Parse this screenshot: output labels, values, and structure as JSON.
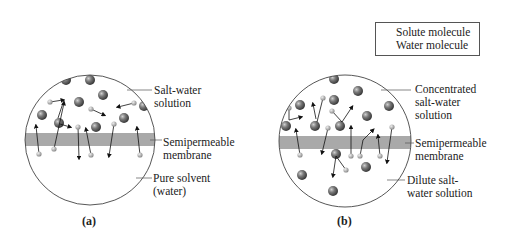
{
  "legend": {
    "solute_label": "Solute molecule",
    "water_label": "Water molecule"
  },
  "panel_a": {
    "caption": "(a)",
    "top_label_1": "Salt-water",
    "top_label_2": "solution",
    "membrane_label_1": "Semipermeable",
    "membrane_label_2": "membrane",
    "bottom_label_1": "Pure solvent",
    "bottom_label_2": "(water)"
  },
  "panel_b": {
    "caption": "(b)",
    "top_label_1": "Concentrated",
    "top_label_2": "salt-water",
    "top_label_3": "solution",
    "membrane_label_1": "Semipermeable",
    "membrane_label_2": "membrane",
    "bottom_label_1": "Dilute salt-",
    "bottom_label_2": "water solution"
  },
  "colors": {
    "membrane": "#a9a9a9",
    "solute": "#6b6b6b",
    "water": "#b8b8b8",
    "outline": "#444444"
  }
}
